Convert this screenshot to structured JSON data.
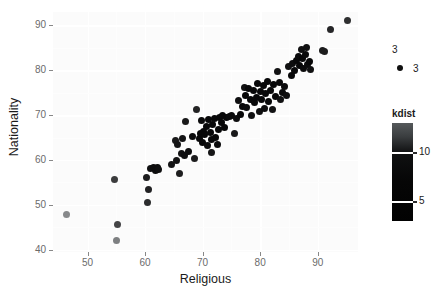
{
  "chart_data": {
    "type": "scatter",
    "title": "",
    "xlabel": "Religious",
    "ylabel": "Nationality",
    "xlim": [
      44,
      97
    ],
    "ylim": [
      39.5,
      93
    ],
    "xticks": [
      50,
      60,
      70,
      80,
      90
    ],
    "yticks": [
      40,
      50,
      60,
      70,
      80,
      90
    ],
    "xticklabels": [
      "50",
      "60",
      "70",
      "80",
      "90"
    ],
    "yticklabels": [
      "40",
      "50",
      "60",
      "70",
      "80",
      "90"
    ],
    "grid": true,
    "legends": [
      {
        "name": "shape-legend",
        "title": "3",
        "type": "discrete",
        "entries": [
          {
            "label": "3",
            "marker": "circle",
            "color": "#101010"
          }
        ]
      },
      {
        "name": "kdist-colorbar",
        "title": "kdist",
        "type": "continuous",
        "ticks": [
          10,
          5
        ],
        "ticklabels": [
          "10",
          "5"
        ],
        "gradient_low": "#020202",
        "gradient_high": "#55595b",
        "range": [
          3,
          13
        ]
      }
    ],
    "series": [
      {
        "name": "countries",
        "marker": "circle",
        "color_by": "kdist",
        "points": [
          {
            "x": 46.4,
            "y": 47.8,
            "kdist": 11.8
          },
          {
            "x": 54.6,
            "y": 55.6,
            "kdist": 6.0
          },
          {
            "x": 55.2,
            "y": 45.6,
            "kdist": 6.6
          },
          {
            "x": 55.1,
            "y": 42.0,
            "kdist": 11.0
          },
          {
            "x": 60.3,
            "y": 56.0,
            "kdist": 4.0
          },
          {
            "x": 60.6,
            "y": 53.4,
            "kdist": 4.3
          },
          {
            "x": 60.5,
            "y": 50.6,
            "kdist": 5.0
          },
          {
            "x": 61.0,
            "y": 58.1,
            "kdist": 3.4
          },
          {
            "x": 61.4,
            "y": 58.3,
            "kdist": 3.2
          },
          {
            "x": 61.8,
            "y": 57.6,
            "kdist": 3.2
          },
          {
            "x": 62.1,
            "y": 58.4,
            "kdist": 3.2
          },
          {
            "x": 62.4,
            "y": 57.8,
            "kdist": 3.3
          },
          {
            "x": 64.6,
            "y": 59.0,
            "kdist": 3.6
          },
          {
            "x": 65.2,
            "y": 64.4,
            "kdist": 3.8
          },
          {
            "x": 65.6,
            "y": 63.5,
            "kdist": 3.6
          },
          {
            "x": 65.5,
            "y": 59.8,
            "kdist": 3.5
          },
          {
            "x": 66.0,
            "y": 57.1,
            "kdist": 4.1
          },
          {
            "x": 66.3,
            "y": 61.5,
            "kdist": 3.4
          },
          {
            "x": 66.8,
            "y": 61.1,
            "kdist": 3.3
          },
          {
            "x": 66.5,
            "y": 64.8,
            "kdist": 3.5
          },
          {
            "x": 67.1,
            "y": 68.6,
            "kdist": 3.8
          },
          {
            "x": 67.6,
            "y": 62.0,
            "kdist": 3.2
          },
          {
            "x": 68.2,
            "y": 65.2,
            "kdist": 3.1
          },
          {
            "x": 68.6,
            "y": 60.3,
            "kdist": 4.0
          },
          {
            "x": 69.0,
            "y": 71.3,
            "kdist": 4.4
          },
          {
            "x": 69.4,
            "y": 64.9,
            "kdist": 3.0
          },
          {
            "x": 69.6,
            "y": 66.0,
            "kdist": 2.9
          },
          {
            "x": 69.8,
            "y": 68.8,
            "kdist": 3.1
          },
          {
            "x": 70.0,
            "y": 64.0,
            "kdist": 3.0
          },
          {
            "x": 70.2,
            "y": 66.4,
            "kdist": 2.8
          },
          {
            "x": 70.4,
            "y": 65.6,
            "kdist": 2.8
          },
          {
            "x": 70.6,
            "y": 67.5,
            "kdist": 2.8
          },
          {
            "x": 70.8,
            "y": 63.2,
            "kdist": 3.2
          },
          {
            "x": 71.0,
            "y": 69.0,
            "kdist": 2.9
          },
          {
            "x": 71.3,
            "y": 66.2,
            "kdist": 2.7
          },
          {
            "x": 71.5,
            "y": 61.6,
            "kdist": 3.6
          },
          {
            "x": 71.6,
            "y": 64.6,
            "kdist": 2.8
          },
          {
            "x": 71.8,
            "y": 67.9,
            "kdist": 2.8
          },
          {
            "x": 72.0,
            "y": 69.3,
            "kdist": 2.9
          },
          {
            "x": 72.2,
            "y": 65.0,
            "kdist": 2.8
          },
          {
            "x": 72.5,
            "y": 63.4,
            "kdist": 3.1
          },
          {
            "x": 72.7,
            "y": 66.8,
            "kdist": 2.8
          },
          {
            "x": 72.9,
            "y": 69.4,
            "kdist": 2.9
          },
          {
            "x": 73.2,
            "y": 68.3,
            "kdist": 2.8
          },
          {
            "x": 73.4,
            "y": 70.0,
            "kdist": 3.0
          },
          {
            "x": 73.8,
            "y": 67.2,
            "kdist": 3.0
          },
          {
            "x": 74.2,
            "y": 69.5,
            "kdist": 3.0
          },
          {
            "x": 74.6,
            "y": 69.8,
            "kdist": 3.1
          },
          {
            "x": 75.1,
            "y": 70.0,
            "kdist": 3.1
          },
          {
            "x": 75.5,
            "y": 66.0,
            "kdist": 3.8
          },
          {
            "x": 75.9,
            "y": 69.2,
            "kdist": 3.2
          },
          {
            "x": 76.3,
            "y": 73.2,
            "kdist": 3.3
          },
          {
            "x": 76.6,
            "y": 70.2,
            "kdist": 3.0
          },
          {
            "x": 76.9,
            "y": 72.0,
            "kdist": 3.0
          },
          {
            "x": 77.2,
            "y": 76.2,
            "kdist": 3.4
          },
          {
            "x": 77.5,
            "y": 74.4,
            "kdist": 3.0
          },
          {
            "x": 77.7,
            "y": 71.8,
            "kdist": 3.1
          },
          {
            "x": 78.0,
            "y": 76.0,
            "kdist": 3.0
          },
          {
            "x": 78.3,
            "y": 73.6,
            "kdist": 2.9
          },
          {
            "x": 78.5,
            "y": 70.0,
            "kdist": 3.4
          },
          {
            "x": 78.8,
            "y": 75.4,
            "kdist": 2.9
          },
          {
            "x": 79.0,
            "y": 72.8,
            "kdist": 2.9
          },
          {
            "x": 79.3,
            "y": 74.0,
            "kdist": 2.8
          },
          {
            "x": 79.5,
            "y": 77.0,
            "kdist": 3.0
          },
          {
            "x": 79.8,
            "y": 70.8,
            "kdist": 3.4
          },
          {
            "x": 80.0,
            "y": 75.2,
            "kdist": 2.8
          },
          {
            "x": 80.2,
            "y": 73.5,
            "kdist": 2.8
          },
          {
            "x": 80.5,
            "y": 76.6,
            "kdist": 2.9
          },
          {
            "x": 80.7,
            "y": 71.6,
            "kdist": 3.2
          },
          {
            "x": 81.0,
            "y": 74.8,
            "kdist": 2.8
          },
          {
            "x": 81.3,
            "y": 77.6,
            "kdist": 3.0
          },
          {
            "x": 81.5,
            "y": 73.0,
            "kdist": 3.0
          },
          {
            "x": 81.8,
            "y": 75.6,
            "kdist": 2.9
          },
          {
            "x": 82.1,
            "y": 71.2,
            "kdist": 3.5
          },
          {
            "x": 82.4,
            "y": 76.8,
            "kdist": 3.0
          },
          {
            "x": 82.7,
            "y": 74.2,
            "kdist": 3.0
          },
          {
            "x": 83.0,
            "y": 79.8,
            "kdist": 3.5
          },
          {
            "x": 83.3,
            "y": 77.2,
            "kdist": 3.0
          },
          {
            "x": 83.6,
            "y": 73.4,
            "kdist": 3.4
          },
          {
            "x": 83.9,
            "y": 75.0,
            "kdist": 3.1
          },
          {
            "x": 84.2,
            "y": 76.4,
            "kdist": 3.1
          },
          {
            "x": 84.6,
            "y": 74.4,
            "kdist": 3.3
          },
          {
            "x": 85.0,
            "y": 80.8,
            "kdist": 3.4
          },
          {
            "x": 85.4,
            "y": 78.8,
            "kdist": 3.0
          },
          {
            "x": 85.7,
            "y": 81.6,
            "kdist": 3.2
          },
          {
            "x": 86.0,
            "y": 80.0,
            "kdist": 2.9
          },
          {
            "x": 86.3,
            "y": 82.2,
            "kdist": 3.0
          },
          {
            "x": 86.6,
            "y": 83.0,
            "kdist": 3.1
          },
          {
            "x": 86.9,
            "y": 81.0,
            "kdist": 2.9
          },
          {
            "x": 87.1,
            "y": 84.6,
            "kdist": 3.4
          },
          {
            "x": 87.4,
            "y": 82.6,
            "kdist": 3.0
          },
          {
            "x": 87.6,
            "y": 80.4,
            "kdist": 3.1
          },
          {
            "x": 87.9,
            "y": 83.6,
            "kdist": 3.1
          },
          {
            "x": 88.1,
            "y": 85.0,
            "kdist": 3.4
          },
          {
            "x": 88.3,
            "y": 81.4,
            "kdist": 3.1
          },
          {
            "x": 88.5,
            "y": 82.0,
            "kdist": 3.0
          },
          {
            "x": 88.7,
            "y": 80.2,
            "kdist": 3.4
          },
          {
            "x": 90.8,
            "y": 84.4,
            "kdist": 4.0
          },
          {
            "x": 91.2,
            "y": 84.2,
            "kdist": 4.0
          },
          {
            "x": 92.3,
            "y": 89.0,
            "kdist": 4.6
          },
          {
            "x": 95.2,
            "y": 91.0,
            "kdist": 5.2
          }
        ]
      }
    ]
  }
}
